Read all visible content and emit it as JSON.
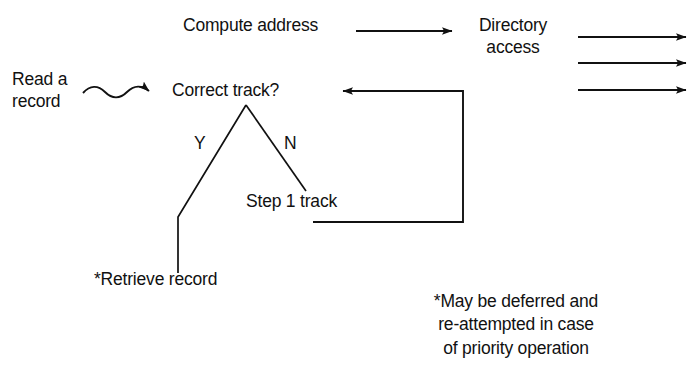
{
  "diagram": {
    "background_color": "#ffffff",
    "stroke_color": "#111111",
    "nodes": {
      "read_record": "Read a\nrecord",
      "compute_address": "Compute address",
      "directory_access": "Directory\naccess",
      "correct_track": "Correct track?",
      "branch_yes": "Y",
      "branch_no": "N",
      "step_track": "Step 1 track",
      "retrieve_record": "*Retrieve record",
      "footnote": "*May be deferred and\nre-attempted in case\nof priority operation"
    },
    "connectors": [
      {
        "name": "wavy-arrow-read-to-correct-track",
        "from": "read_record",
        "to": "correct_track",
        "style": "wavy",
        "arrowhead": "end"
      },
      {
        "name": "arrow-compute-to-directory",
        "from": "compute_address",
        "to": "directory_access",
        "style": "straight",
        "arrowhead": "end"
      },
      {
        "name": "arrow-directory-out-1",
        "from": "directory_access",
        "to": "",
        "style": "straight",
        "arrowhead": "end"
      },
      {
        "name": "arrow-directory-out-2",
        "from": "directory_access",
        "to": "",
        "style": "straight",
        "arrowhead": "end"
      },
      {
        "name": "arrow-directory-out-3",
        "from": "directory_access",
        "to": "",
        "style": "straight",
        "arrowhead": "end"
      },
      {
        "name": "branch-yes-line",
        "from": "correct_track",
        "to": "retrieve_record",
        "style": "polyline",
        "arrowhead": "none"
      },
      {
        "name": "branch-no-line",
        "from": "correct_track",
        "to": "step_track",
        "style": "straight",
        "arrowhead": "none"
      },
      {
        "name": "feedback-loop-step-to-correct-track",
        "from": "step_track",
        "to": "correct_track",
        "style": "orthogonal",
        "arrowhead": "end"
      }
    ]
  }
}
